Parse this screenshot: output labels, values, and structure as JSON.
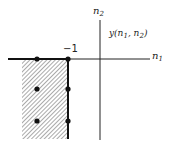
{
  "diagram": {
    "axis_labels": {
      "x": "n",
      "x_sub": "1",
      "y": "n",
      "y_sub": "2"
    },
    "tick_label": "−1",
    "function_label": {
      "prefix": "y(n",
      "sub1": "1",
      "mid": ", n",
      "sub2": "2",
      "suffix": ")"
    },
    "points": [
      {
        "n1": -2,
        "n2": 0
      },
      {
        "n1": -1,
        "n2": 0
      },
      {
        "n1": -2,
        "n2": -1
      },
      {
        "n1": -1,
        "n2": -1
      },
      {
        "n1": -2,
        "n2": -2
      },
      {
        "n1": -1,
        "n2": -2
      }
    ],
    "shaded_region": "n1 <= -1, n2 <= 0"
  }
}
